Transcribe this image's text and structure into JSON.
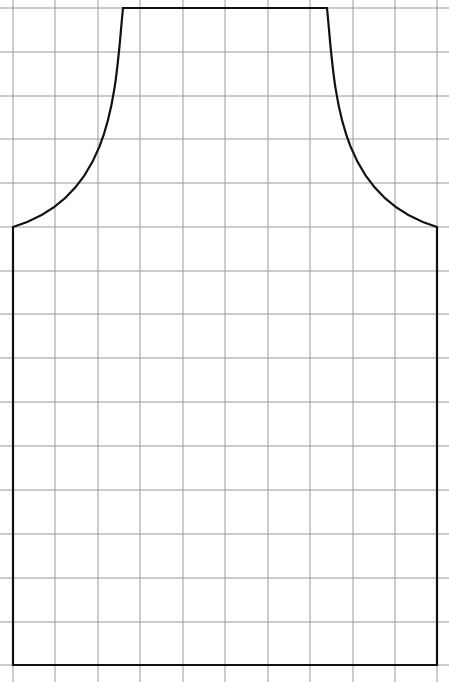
{
  "diagram": {
    "type": "sewing-pattern-grid",
    "grid": {
      "color": "#9a9a9a",
      "line_width": 1,
      "vertical_x": [
        13,
        55,
        98,
        140,
        183,
        225,
        268,
        310,
        353,
        395,
        437
      ],
      "horizontal_y": [
        8,
        52,
        96,
        139,
        183,
        227,
        271,
        314,
        358,
        402,
        446,
        490,
        534,
        578,
        622,
        665
      ],
      "extent": {
        "x0": 0,
        "x1": 449,
        "y0": 0,
        "y1": 682
      }
    },
    "outline": {
      "color": "#111111",
      "line_width": 2.2,
      "top_edge": {
        "y": 8,
        "x_left": 123,
        "x_right": 327
      },
      "shoulder": {
        "y": 227,
        "x_left": 13,
        "x_right": 437
      },
      "bottom_edge": {
        "y": 665
      }
    }
  }
}
